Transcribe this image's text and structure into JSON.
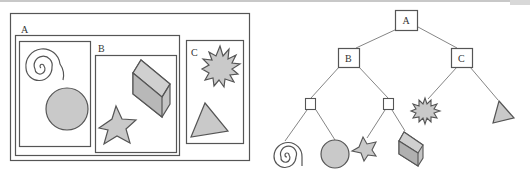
{
  "colors": {
    "stroke": "#555555",
    "fill": "#c9c9c9",
    "dark_fill": "#a8a8a8",
    "line": "#777777"
  },
  "left_diagram": {
    "title": "Nested boxes",
    "groups": [
      {
        "label": "A",
        "contents": [
          "spiral",
          "circle"
        ]
      },
      {
        "label": "B",
        "contents": [
          "cube",
          "star"
        ]
      },
      {
        "label": "C",
        "contents": [
          "starburst",
          "triangle"
        ]
      }
    ]
  },
  "right_diagram": {
    "title": "Tree",
    "nodes": [
      {
        "id": "A",
        "label": "A",
        "children": [
          "B",
          "C"
        ]
      },
      {
        "id": "B",
        "label": "B",
        "children": [
          "g1",
          "g2"
        ]
      },
      {
        "id": "C",
        "label": "C",
        "children": [
          "starburst",
          "triangle"
        ]
      },
      {
        "id": "g1",
        "label": "",
        "children": [
          "spiral",
          "circle"
        ]
      },
      {
        "id": "g2",
        "label": "",
        "children": [
          "star",
          "cube"
        ]
      }
    ],
    "leaves": [
      "spiral",
      "circle",
      "star",
      "cube",
      "starburst",
      "triangle"
    ]
  }
}
